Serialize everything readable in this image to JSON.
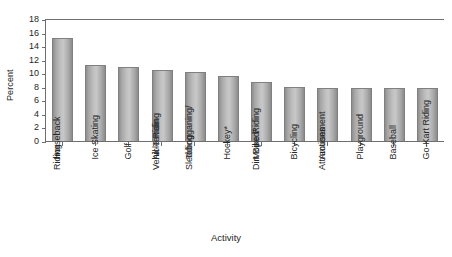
{
  "chart_data": {
    "type": "bar",
    "title": "",
    "xlabel": "Activity",
    "ylabel": "Percent",
    "ylim": [
      0,
      18
    ],
    "ytick_step": 2,
    "yticks": [
      0,
      2,
      4,
      6,
      8,
      10,
      12,
      14,
      16,
      18
    ],
    "ytick_labels": [
      "0",
      "2",
      "4",
      "6",
      "8",
      "10",
      "12",
      "14",
      "16",
      "18"
    ],
    "grid": false,
    "legend": "none",
    "orientation": "vertical",
    "bar_color": "#b8b8b8",
    "bar_edge_color": "#808080",
    "categories": [
      "Horseback Riding",
      "Ice Skating",
      "Golf",
      "All-Terrain Vehicle Riding",
      "Tobogganing/ Sledding",
      "Hockey*",
      "Moped/ Dirt Bike Riding",
      "Bicycling",
      "Amusement Attractions",
      "Playground",
      "Baseball",
      "Go-Kart Riding"
    ],
    "category_lines": [
      [
        "Horseback",
        "Riding"
      ],
      [
        "Ice Skating"
      ],
      [
        "Golf"
      ],
      [
        "All-Terrain",
        "Vehicle Riding"
      ],
      [
        "Tobogganing/",
        "Sledding"
      ],
      [
        "Hockey*"
      ],
      [
        "Moped/",
        "Dirt Bike Riding"
      ],
      [
        "Bicycling"
      ],
      [
        "Amusement",
        "Attractions"
      ],
      [
        "Playground"
      ],
      [
        "Baseball"
      ],
      [
        "Go-Kart Riding"
      ]
    ],
    "values": [
      15.3,
      11.4,
      11.0,
      10.6,
      10.3,
      9.8,
      8.8,
      8.1,
      8.0,
      7.9,
      7.9,
      7.9
    ]
  }
}
